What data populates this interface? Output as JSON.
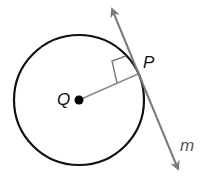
{
  "diagram": {
    "type": "geometry",
    "labels": {
      "center": "Q",
      "tangent_point": "P",
      "line": "m"
    },
    "colors": {
      "circle": "#111111",
      "tangent_line": "#7a7a7a",
      "radius": "#8a8a8a",
      "center_dot": "#000000"
    }
  }
}
